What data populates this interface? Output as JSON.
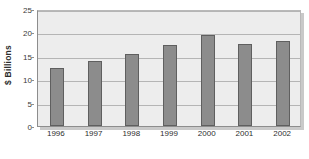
{
  "chart_data": {
    "type": "bar",
    "title": "",
    "subtitle": "",
    "xlabel": "",
    "ylabel": "$ Billions",
    "categories": [
      "1996",
      "1997",
      "1998",
      "1999",
      "2000",
      "2001",
      "2002"
    ],
    "values": [
      12.4,
      13.8,
      15.3,
      17.4,
      19.4,
      17.5,
      18.2
    ],
    "series": [
      {
        "name": "",
        "values": [
          12.4,
          13.8,
          15.3,
          17.4,
          19.4,
          17.5,
          18.2
        ]
      }
    ],
    "ylim": [
      0,
      25
    ],
    "yticks": [
      0,
      5,
      10,
      15,
      20,
      25
    ],
    "ytick_labels": [
      "0",
      "5",
      "10",
      "15",
      "20",
      "25"
    ],
    "grid": true,
    "grid_axis": "y",
    "legend": false,
    "legend_position": "none",
    "annotations": [],
    "colors": {
      "bar_fill": "#8c8c8c",
      "bar_edge": "#5f5f5f",
      "plot_background": "#ededed",
      "gridline": "#b5b5b5",
      "axis_text": "#2e2e2e",
      "figure_background": "#ffffff"
    }
  }
}
